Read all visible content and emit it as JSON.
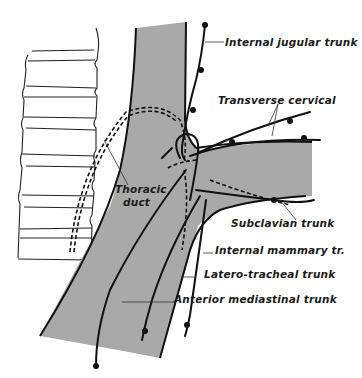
{
  "diagram": {
    "labels": {
      "internal_jugular": "Internal jugular trunk",
      "transverse_cervical": "Transverse cervical",
      "thoracic_duct_line1": "Thoracic",
      "thoracic_duct_line2": "duct",
      "subclavian": "Subclavian trunk",
      "internal_mammary": "Internal mammary tr.",
      "latero_tracheal": "Latero-tracheal trunk",
      "anterior_mediastinal": "Anterior mediastinal trunk"
    },
    "colors": {
      "vessel_fill": "#a9a9a9",
      "line": "#111111",
      "background": "#ffffff"
    }
  }
}
